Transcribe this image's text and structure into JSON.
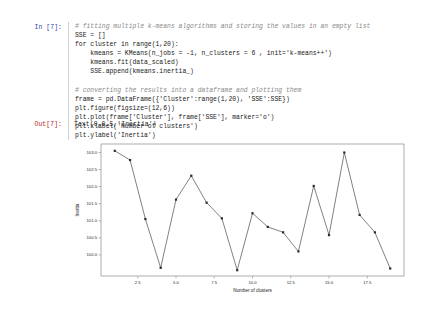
{
  "notebook": {
    "input_prompt": "In [7]:",
    "output_prompt": "Out[7]:",
    "output_text": "Text(0,0.5,'Inertia')",
    "code_lines": [
      "# fitting multiple k-means algorithms and storing the values in an empty list",
      "SSE = []",
      "for cluster in range(1,20):",
      "    kmeans = KMeans(n_jobs = -1, n_clusters = 6 , init='k-means++')",
      "    kmeans.fit(data_scaled)",
      "    SSE.append(kmeans.inertia_)",
      "",
      "# converting the results into a dataframe and plotting them",
      "frame = pd.DataFrame({'Cluster':range(1,20), 'SSE':SSE})",
      "plt.figure(figsize=(12,6))",
      "plt.plot(frame['Cluster'], frame['SSE'], marker='o')",
      "plt.xlabel('Number of clusters')",
      "plt.ylabel('Inertia')"
    ]
  },
  "chart_data": {
    "type": "line",
    "title": "",
    "xlabel": "Number of clusters",
    "ylabel": "Inertia",
    "marker": "o",
    "grid": false,
    "legend": false,
    "line_color": "#4a4a4a",
    "marker_color": "#2b2b2b",
    "x": [
      1,
      2,
      3,
      4,
      5,
      6,
      7,
      8,
      9,
      10,
      11,
      12,
      13,
      14,
      15,
      16,
      17,
      18,
      19
    ],
    "values": [
      103.05,
      102.78,
      101.05,
      99.62,
      101.62,
      102.32,
      101.53,
      101.07,
      99.55,
      101.22,
      100.82,
      100.66,
      100.1,
      102.02,
      100.58,
      103.0,
      101.17,
      100.66,
      99.6
    ],
    "xlim": [
      0.1,
      19.9
    ],
    "ylim": [
      99.38,
      103.25
    ],
    "xticks": [
      2.5,
      5.0,
      7.5,
      10.0,
      12.5,
      15.0,
      17.5
    ],
    "xticklabels": [
      "2.5",
      "5.0",
      "7.5",
      "10.0",
      "12.5",
      "15.0",
      "17.5"
    ],
    "yticks": [
      100.0,
      100.5,
      101.0,
      101.5,
      102.0,
      102.5,
      103.0
    ],
    "yticklabels": [
      "100.0",
      "100.5",
      "101.0",
      "101.5",
      "102.0",
      "102.5",
      "103.0"
    ]
  }
}
